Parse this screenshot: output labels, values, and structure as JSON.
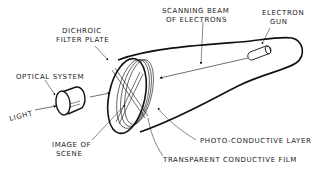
{
  "diagram": {
    "colors": {
      "line": "#111111",
      "text": "#222222",
      "background": "#ffffff"
    },
    "labels": {
      "dichroic_line1": "DICHROIC",
      "dichroic_line2": "FILTER PLATE",
      "scanning_line1": "SCANNING BEAM",
      "scanning_line2": "OF ELECTRONS",
      "gun_line1": "ELECTRON",
      "gun_line2": "GUN",
      "optical": "OPTICAL SYSTEM",
      "light": "LIGHT",
      "image_line1": "IMAGE OF",
      "image_line2": "SCENE",
      "photo": "PHOTO-CONDUCTIVE LAYER",
      "film": "TRANSPARENT CONDUCTIVE FILM"
    }
  }
}
